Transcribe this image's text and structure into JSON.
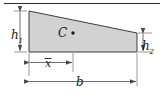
{
  "figure": {
    "type": "engineering-diagram",
    "background_color": "#ffffff",
    "shape": {
      "name": "trapezoid",
      "fill_color": "#d2d2d2",
      "stroke_color": "#3c3c3c",
      "vertices": [
        {
          "x": 29,
          "y": 11
        },
        {
          "x": 137,
          "y": 33
        },
        {
          "x": 137,
          "y": 52
        },
        {
          "x": 29,
          "y": 52
        }
      ]
    },
    "centroid": {
      "label": "C",
      "marker": "dot",
      "marker_color": "#1a1a1a",
      "label_x": 62,
      "label_y": 36,
      "dot_x": 73,
      "dot_y": 33
    },
    "dimensions": [
      {
        "name": "h1",
        "label": "h",
        "subscript": "1",
        "orientation": "vertical",
        "position": "left",
        "label_x": 14,
        "label_y": 36
      },
      {
        "name": "h2",
        "label": "h",
        "subscript": "2",
        "orientation": "vertical",
        "position": "right",
        "label_x": 145,
        "label_y": 47
      },
      {
        "name": "x-bar",
        "label": "x",
        "overbar": true,
        "orientation": "horizontal",
        "position": "lower-middle",
        "label_x": 47,
        "label_y": 66
      },
      {
        "name": "b",
        "label": "b",
        "orientation": "horizontal",
        "position": "bottom",
        "label_x": 79,
        "label_y": 85
      }
    ],
    "rules": [
      {
        "name": "top-border-rule",
        "color": "#2b2b2b"
      }
    ],
    "line_color": "#555555"
  }
}
